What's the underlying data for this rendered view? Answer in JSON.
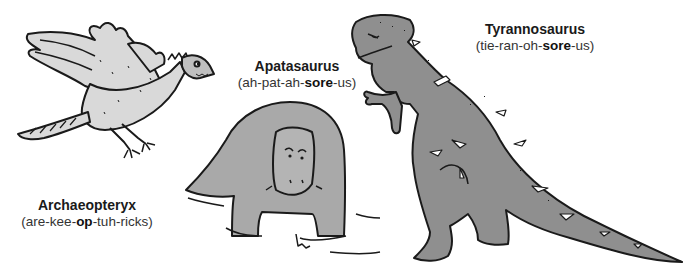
{
  "illustration": {
    "style": "black-line cartoon with gray fill",
    "colors": {
      "background": "#ffffff",
      "outline": "#1a1a1a",
      "archaeopteryx_fill": "#d9d9d9",
      "apatasaurus_fill": "#a9a9a9",
      "tyrannosaurus_fill": "#8f8f8f",
      "highlight": "#ffffff"
    }
  },
  "dinosaurs": [
    {
      "id": "archaeopteryx",
      "name": "Archaeopteryx",
      "pron_parts": [
        "(are-kee-",
        "op",
        "-tuh-ricks)"
      ]
    },
    {
      "id": "apatasaurus",
      "name": "Apatasaurus",
      "pron_parts": [
        "(ah-pat-ah-",
        "sore",
        "-us)"
      ]
    },
    {
      "id": "tyrannosaurus",
      "name": "Tyrannosaurus",
      "pron_parts": [
        "(tie-ran-oh-",
        "sore",
        "-us)"
      ]
    }
  ]
}
